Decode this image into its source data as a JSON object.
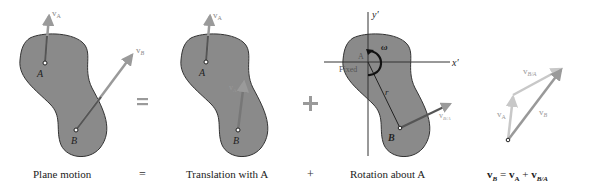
{
  "panels": [
    {
      "id": "plane-motion",
      "caption": "Plane motion",
      "points": {
        "A": "A",
        "B": "B"
      },
      "vectors": {
        "vA": "v",
        "vA_sub": "A",
        "vB": "v",
        "vB_sub": "B"
      }
    },
    {
      "id": "translation",
      "caption": "Translation with A",
      "points": {
        "A": "A",
        "B": "B"
      },
      "vectors": {
        "vA_top": "v",
        "vA_top_sub": "A",
        "vA_B": "v",
        "vA_B_sub": "A"
      }
    },
    {
      "id": "rotation",
      "caption": "Rotation about A",
      "points": {
        "A": "A",
        "B": "B"
      },
      "labels": {
        "fixed": "Fixed",
        "omega": "ω",
        "r": "r",
        "x_axis": "x′",
        "y_axis": "y′"
      },
      "vectors": {
        "vBA": "v",
        "vBA_sub": "B/A"
      }
    },
    {
      "id": "vector-sum",
      "caption_parts": {
        "vB": "v",
        "vB_sub": "B",
        "eq": " = ",
        "vA": "v",
        "vA_sub": "A",
        "plus": " + ",
        "vBA": "v",
        "vBA_sub": "B/A"
      },
      "vectors": {
        "vA": "v",
        "vA_sub": "A",
        "vB": "v",
        "vB_sub": "B",
        "vBA": "v",
        "vBA_sub": "B/A"
      }
    }
  ],
  "operators": {
    "equals": "=",
    "plus": "+"
  },
  "colors": {
    "body_fill": "#8a8a8a",
    "body_stroke": "#333333",
    "arrow_dark": "#555555",
    "arrow_mid": "#9a9a9a",
    "arrow_light": "#c4c4c4",
    "operator": "#9a9a9a"
  }
}
